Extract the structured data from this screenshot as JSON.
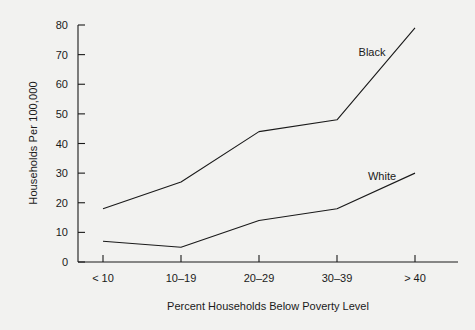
{
  "chart_data": {
    "type": "line",
    "title": "",
    "xlabel": "Percent Households Below Poverty Level",
    "ylabel": "Households Per 100,000",
    "categories": [
      "< 10",
      "10–19",
      "20–29",
      "30–39",
      "> 40"
    ],
    "series": [
      {
        "name": "Black",
        "values": [
          18,
          27,
          44,
          48,
          79
        ],
        "color": "#1a1a1a"
      },
      {
        "name": "White",
        "values": [
          7,
          5,
          14,
          18,
          30
        ],
        "color": "#1a1a1a"
      }
    ],
    "ylim": [
      0,
      80
    ],
    "yticks": [
      0,
      10,
      20,
      30,
      40,
      50,
      60,
      70,
      80
    ],
    "ytick_labels": [
      "0",
      "10",
      "20",
      "30",
      "40",
      "50",
      "60",
      "70",
      "80"
    ],
    "grid": false,
    "legend": "inline-labels",
    "legend_position": "right-of-lines",
    "background_color": "#f2f2f0",
    "axis_color": "#1a1a1a"
  },
  "annotations": {
    "black_label": "Black",
    "white_label": "White"
  }
}
